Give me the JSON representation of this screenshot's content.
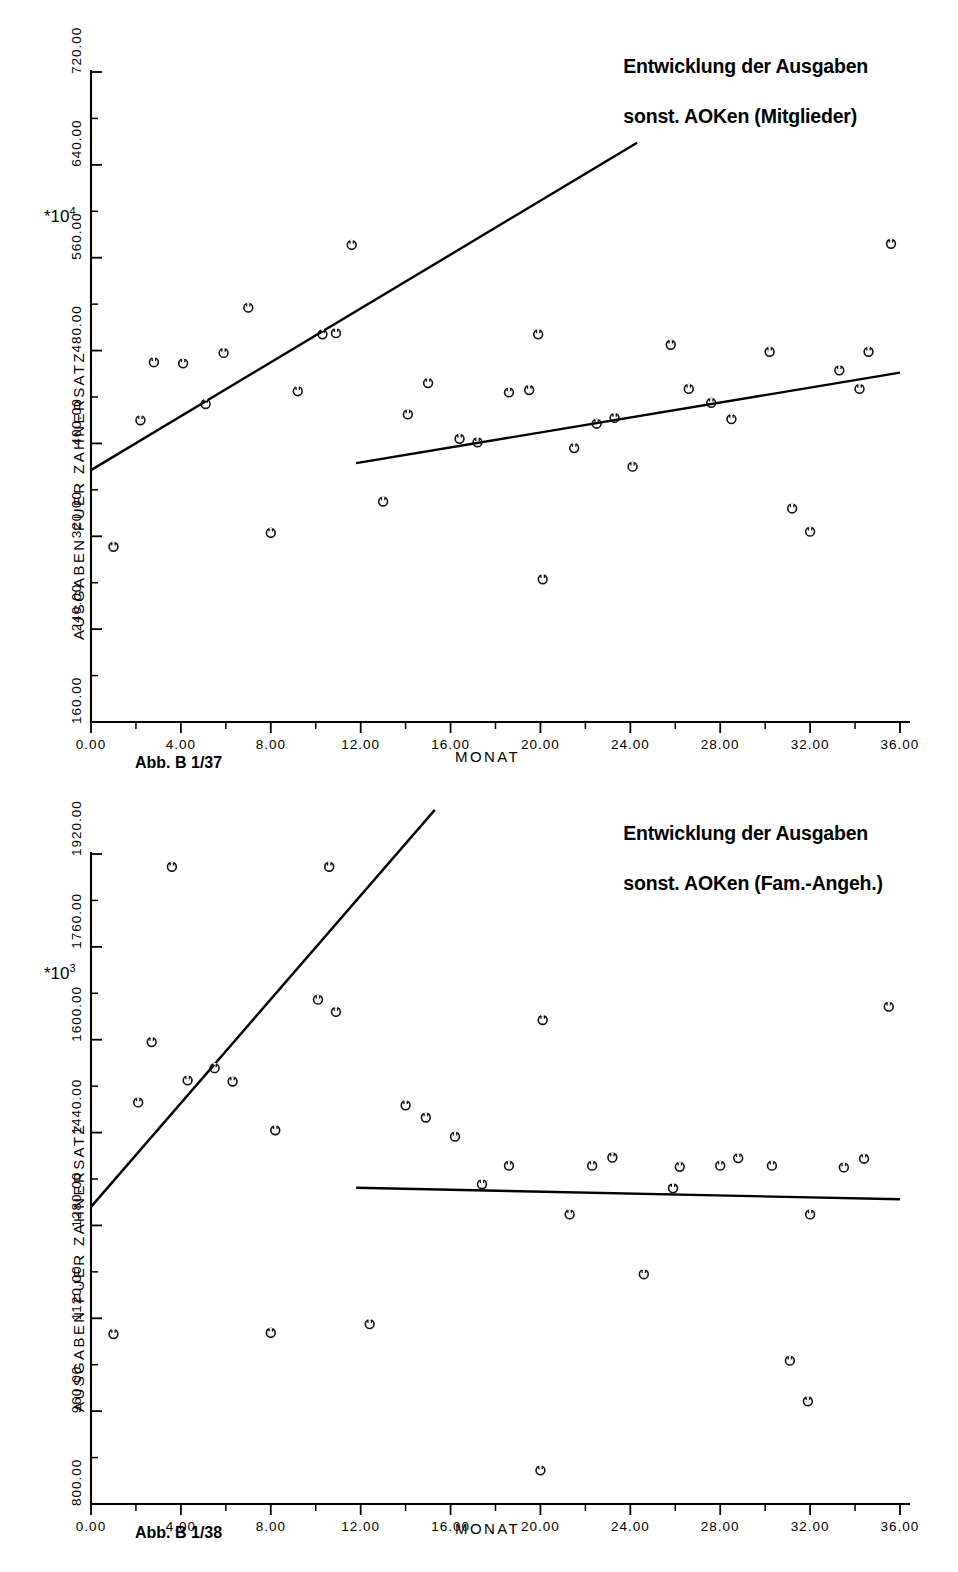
{
  "figures": [
    {
      "id": "fig1",
      "title_line1": "Entwicklung der Ausgaben",
      "title_line2": "sonst. AOKen (Mitglieder)",
      "caption": "Abb. B 1/37",
      "xlabel": "MONAT",
      "ylabel": "AUSGABEN FUER ZAHNERSATZ",
      "multiplier_base": "*10",
      "multiplier_exp": "4",
      "chart_data": {
        "type": "scatter",
        "title": "Entwicklung der Ausgaben sonst. AOKen (Mitglieder)",
        "xlabel": "MONAT",
        "ylabel": "AUSGABEN FUER ZAHNERSATZ",
        "y_multiplier": "*10^4",
        "xlim": [
          0,
          36
        ],
        "ylim": [
          160,
          720
        ],
        "xticks": [
          "0.00",
          "4.00",
          "8.00",
          "12.00",
          "16.00",
          "20.00",
          "24.00",
          "28.00",
          "32.00",
          "36.00"
        ],
        "yticks": [
          "160.00",
          "240.00",
          "320.00",
          "400.00",
          "480.00",
          "560.00",
          "640.00",
          "720.00"
        ],
        "grid": false,
        "legend": "none",
        "series": [
          {
            "name": "Beobachtungen",
            "marker": "circle-open",
            "points": [
              [
                1.0,
                311
              ],
              [
                2.2,
                420
              ],
              [
                2.8,
                470
              ],
              [
                4.1,
                469
              ],
              [
                5.1,
                434
              ],
              [
                5.9,
                478
              ],
              [
                7.0,
                517
              ],
              [
                8.0,
                323
              ],
              [
                9.2,
                445
              ],
              [
                10.3,
                494
              ],
              [
                10.9,
                495
              ],
              [
                11.6,
                571
              ],
              [
                13.0,
                350
              ],
              [
                14.1,
                425
              ],
              [
                15.0,
                452
              ],
              [
                16.4,
                404
              ],
              [
                17.2,
                401
              ],
              [
                18.6,
                444
              ],
              [
                19.5,
                446
              ],
              [
                19.9,
                494
              ],
              [
                20.1,
                283
              ],
              [
                21.5,
                396
              ],
              [
                22.5,
                417
              ],
              [
                23.3,
                422
              ],
              [
                24.1,
                380
              ],
              [
                25.8,
                485
              ],
              [
                26.6,
                447
              ],
              [
                27.6,
                435
              ],
              [
                28.5,
                421
              ],
              [
                30.2,
                479
              ],
              [
                31.2,
                344
              ],
              [
                32.0,
                324
              ],
              [
                33.3,
                463
              ],
              [
                34.2,
                447
              ],
              [
                34.6,
                479
              ],
              [
                35.6,
                572
              ]
            ]
          }
        ],
        "trend_lines": [
          {
            "name": "Trend 1-12",
            "x_from": 0.0,
            "x_to": 24.3,
            "y_from": 377,
            "y_to": 659
          },
          {
            "name": "Trend 13-36",
            "x_from": 11.8,
            "x_to": 36.0,
            "y_from": 383,
            "y_to": 461
          }
        ]
      }
    },
    {
      "id": "fig2",
      "title_line1": "Entwicklung der Ausgaben",
      "title_line2": "sonst. AOKen (Fam.-Angeh.)",
      "caption": "Abb. B 1/38",
      "xlabel": "MONAT",
      "ylabel": "AUSGABEN FUER ZAHNERSATZ",
      "multiplier_base": "*10",
      "multiplier_exp": "3",
      "chart_data": {
        "type": "scatter",
        "title": "Entwicklung der Ausgaben sonst. AOKen (Fam.-Angeh.)",
        "xlabel": "MONAT",
        "ylabel": "AUSGABEN FUER ZAHNERSATZ",
        "y_multiplier": "*10^3",
        "xlim": [
          0,
          36
        ],
        "ylim": [
          800,
          1920
        ],
        "xticks": [
          "0.00",
          "4.00",
          "8.00",
          "12.00",
          "16.00",
          "20.00",
          "24.00",
          "28.00",
          "32.00",
          "36.00"
        ],
        "yticks": [
          "800.00",
          "960.00",
          "1120.00",
          "1280.00",
          "1440.00",
          "1600.00",
          "1760.00",
          "1920.00"
        ],
        "grid": false,
        "legend": "none",
        "series": [
          {
            "name": "Beobachtungen",
            "marker": "circle-open",
            "points": [
              [
                1.0,
                1093
              ],
              [
                2.1,
                1492
              ],
              [
                2.7,
                1596
              ],
              [
                3.6,
                1898
              ],
              [
                4.3,
                1530
              ],
              [
                5.5,
                1551
              ],
              [
                6.3,
                1528
              ],
              [
                8.0,
                1095
              ],
              [
                8.2,
                1444
              ],
              [
                10.1,
                1669
              ],
              [
                10.6,
                1898
              ],
              [
                10.9,
                1648
              ],
              [
                12.4,
                1110
              ],
              [
                14.0,
                1487
              ],
              [
                14.9,
                1466
              ],
              [
                16.2,
                1433
              ],
              [
                17.4,
                1351
              ],
              [
                18.6,
                1383
              ],
              [
                20.0,
                858
              ],
              [
                20.1,
                1634
              ],
              [
                21.3,
                1299
              ],
              [
                22.3,
                1383
              ],
              [
                23.2,
                1397
              ],
              [
                24.6,
                1196
              ],
              [
                25.9,
                1344
              ],
              [
                26.2,
                1381
              ],
              [
                28.0,
                1383
              ],
              [
                28.8,
                1396
              ],
              [
                30.3,
                1383
              ],
              [
                31.1,
                1047
              ],
              [
                31.9,
                977
              ],
              [
                32.0,
                1299
              ],
              [
                33.5,
                1380
              ],
              [
                34.4,
                1395
              ],
              [
                35.5,
                1657
              ]
            ]
          }
        ],
        "trend_lines": [
          {
            "name": "Trend 1-12",
            "x_from": 0.0,
            "x_to": 15.3,
            "y_from": 1312,
            "y_to": 1996
          },
          {
            "name": "Trend 13-36",
            "x_from": 11.8,
            "x_to": 36.0,
            "y_from": 1345,
            "y_to": 1325
          }
        ]
      }
    }
  ]
}
